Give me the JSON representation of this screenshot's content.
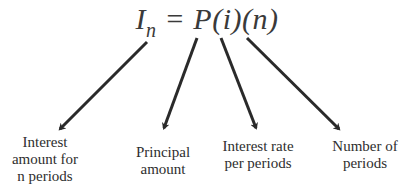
{
  "formula": {
    "lhs_symbol": "I",
    "lhs_subscript": "n",
    "equals": "=",
    "rhs": "P(i)(n)"
  },
  "labels": [
    {
      "target": "I_n",
      "lines": [
        "Interest",
        "amount for",
        "n periods"
      ]
    },
    {
      "target": "P",
      "lines": [
        "Principal",
        "amount"
      ]
    },
    {
      "target": "i",
      "lines": [
        "Interest rate",
        "per periods"
      ]
    },
    {
      "target": "n",
      "lines": [
        "Number of",
        "periods"
      ]
    }
  ],
  "colors": {
    "arrow": "#2a2a2a",
    "text": "#2e2e2e",
    "background": "#ffffff"
  }
}
